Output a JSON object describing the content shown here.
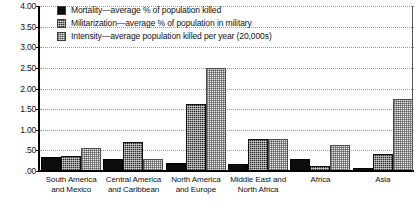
{
  "chart_data": {
    "type": "bar",
    "title": "",
    "xlabel": "",
    "ylabel": "",
    "ylim": [
      0,
      4.0
    ],
    "ytick_labels": [
      "4.00",
      "3.50",
      "3.00",
      "2.50",
      "2.00",
      "1.50",
      "1.00",
      ".50",
      ".00"
    ],
    "ytick_values": [
      4.0,
      3.5,
      3.0,
      2.5,
      2.0,
      1.5,
      1.0,
      0.5,
      0.0
    ],
    "grid": "horizontal-dotted",
    "legend_position": "top-left-inside",
    "categories": [
      "South America and Mexico",
      "Central America and Caribbean",
      "North America and Europe",
      "Middle East and North Africa",
      "Africa",
      "Asia"
    ],
    "series": [
      {
        "name": "Mortality—average % of population killed",
        "values": [
          0.35,
          0.28,
          0.2,
          0.17,
          0.3,
          0.08
        ]
      },
      {
        "name": "Militarization—average % of population in military",
        "values": [
          0.37,
          0.7,
          1.62,
          0.78,
          0.12,
          0.42
        ]
      },
      {
        "name": "Intensity—average population killed per year (20,000s)",
        "values": [
          0.55,
          0.3,
          2.5,
          0.78,
          0.62,
          1.75
        ]
      }
    ]
  },
  "legend": {
    "items": [
      {
        "label": "Mortality—average % of population killed"
      },
      {
        "label": "Militarization—average % of population in military"
      },
      {
        "label": "Intensity—average population killed per year (20,000s)"
      }
    ]
  },
  "colors": {
    "mortality": "#0d0d0d",
    "militarization": "#2b2b2b",
    "intensity": "#e9e9e9",
    "axis": "#000000",
    "gridline": "#9a9a9a"
  }
}
